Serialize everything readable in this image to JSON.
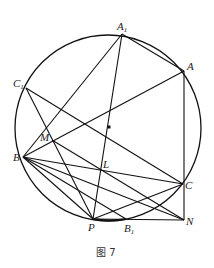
{
  "figure": {
    "caption": "图 7",
    "circle": {
      "cx": 108,
      "cy": 128,
      "r": 93
    },
    "center_dot": {
      "x": 109,
      "y": 127
    },
    "points": {
      "A1": {
        "x": 122,
        "y": 34,
        "label": "A",
        "sub": "1"
      },
      "A": {
        "x": 184,
        "y": 71,
        "label": "A",
        "sub": ""
      },
      "C1": {
        "x": 26,
        "y": 88,
        "label": "C",
        "sub": "1"
      },
      "M": {
        "x": 52,
        "y": 140,
        "label": "M",
        "sub": ""
      },
      "B": {
        "x": 23,
        "y": 157,
        "label": "B",
        "sub": ""
      },
      "L": {
        "x": 101,
        "y": 169,
        "label": "L",
        "sub": ""
      },
      "C": {
        "x": 183,
        "y": 184,
        "label": "C",
        "sub": ""
      },
      "P": {
        "x": 93,
        "y": 219,
        "label": "P",
        "sub": ""
      },
      "B1": {
        "x": 126,
        "y": 219,
        "label": "B",
        "sub": "1"
      },
      "N": {
        "x": 184,
        "y": 220,
        "label": "N",
        "sub": ""
      }
    },
    "segments": [
      [
        "A1",
        "A"
      ],
      [
        "A1",
        "B"
      ],
      [
        "A1",
        "P"
      ],
      [
        "A",
        "B"
      ],
      [
        "A",
        "N"
      ],
      [
        "C1",
        "C"
      ],
      [
        "C1",
        "P"
      ],
      [
        "M",
        "N"
      ],
      [
        "B",
        "C"
      ],
      [
        "B",
        "N"
      ],
      [
        "B",
        "B1"
      ],
      [
        "B",
        "P"
      ],
      [
        "P",
        "C"
      ],
      [
        "P",
        "N"
      ]
    ]
  }
}
